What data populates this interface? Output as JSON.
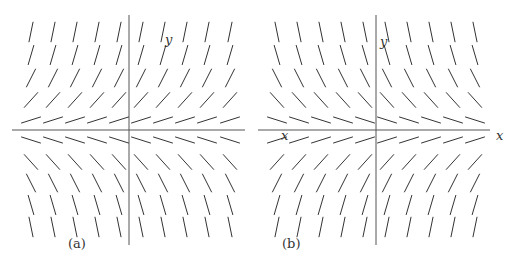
{
  "figure": {
    "panels": [
      {
        "id": "a",
        "caption": "(a)",
        "caption_pos": [
          68,
          248
        ],
        "equation_sign": 1,
        "x_axis": {
          "x1": 12,
          "x2": 245,
          "y": 130,
          "label": ""
        },
        "y_axis": {
          "x": 129,
          "y1": 15,
          "y2": 245,
          "label": "y",
          "label_pos": [
            165,
            44
          ]
        },
        "columns": [
          31,
          53,
          75,
          97,
          119,
          141,
          163,
          185,
          207,
          230
        ],
        "rows": [
          32,
          55,
          78,
          100,
          120,
          140,
          162,
          183,
          205,
          227
        ]
      },
      {
        "id": "b",
        "caption": "(b)",
        "caption_pos": [
          282,
          248
        ],
        "equation_sign": -1,
        "x_axis": {
          "x1": 258,
          "x2": 490,
          "y": 130,
          "label": "x",
          "label_pos": [
            496,
            140
          ],
          "inner_label": "x",
          "inner_label_pos": [
            281,
            140
          ]
        },
        "y_axis": {
          "x": 376,
          "y1": 15,
          "y2": 245,
          "label": "y",
          "label_pos": [
            380,
            46
          ]
        },
        "columns": [
          277,
          299,
          321,
          343,
          365,
          387,
          409,
          431,
          453,
          475
        ],
        "rows": [
          32,
          55,
          78,
          100,
          120,
          140,
          162,
          183,
          205,
          227
        ]
      }
    ],
    "row_slopes": [
      5.0,
      3.4,
      2.0,
      1.1,
      0.32,
      -0.32,
      -1.1,
      -2.0,
      -3.4,
      -5.0
    ],
    "segment_length": 20
  }
}
